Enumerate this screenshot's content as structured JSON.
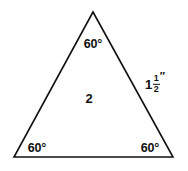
{
  "figure": {
    "type": "equilateral-triangle-diagram",
    "background_color": "#ffffff",
    "stroke_color": "#111111",
    "stroke_width": 1.6,
    "width": 188,
    "height": 171
  },
  "shape": {
    "name": "triangle",
    "vertices": {
      "apex": {
        "x": 93,
        "y": 12
      },
      "bottom_left": {
        "x": 14,
        "y": 157
      },
      "bottom_right": {
        "x": 173,
        "y": 157
      }
    }
  },
  "labels": {
    "angle_top": "60°",
    "angle_bottom_left": "60°",
    "angle_bottom_right": "60°",
    "interior_value": "2",
    "side_right": {
      "whole": "1",
      "numerator": "1",
      "denominator": "2",
      "unit_mark": "″",
      "plain_text": "1 1/2″"
    }
  }
}
